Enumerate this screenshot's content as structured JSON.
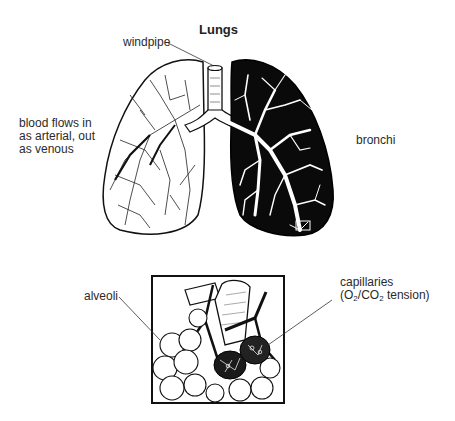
{
  "diagram": {
    "title": "Lungs",
    "labels": {
      "windpipe": "windpipe",
      "blood_flow_line1": "blood flows in",
      "blood_flow_line2": "as arterial, out",
      "blood_flow_line3": "as venous",
      "bronchi": "bronchi",
      "alveoli": "alveoli",
      "capillaries_line1": "capillaries",
      "capillaries_paren_open": "(O",
      "capillaries_sub1": "2",
      "capillaries_mid": "/CO",
      "capillaries_sub2": "2",
      "capillaries_tail": " tension)"
    },
    "colors": {
      "ink": "#111111",
      "background": "#ffffff"
    }
  }
}
